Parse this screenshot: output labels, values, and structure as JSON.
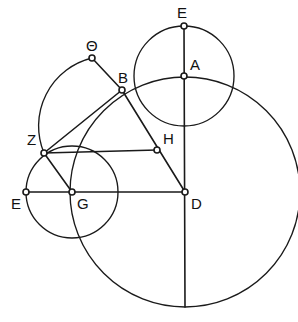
{
  "figure": {
    "background_color": "#ffffff",
    "stroke_color": "#1a1a1a",
    "width": 298,
    "height": 322
  },
  "labels": {
    "theta": "Θ",
    "e_top": "E",
    "a": "A",
    "b": "B",
    "h": "H",
    "z": "Z",
    "e_left": "E",
    "g": "G",
    "d": "D"
  },
  "chart_data": {
    "type": "diagram",
    "xlabel": "",
    "ylabel": "",
    "xlim": [
      0,
      298
    ],
    "ylim": [
      0,
      322
    ],
    "grid": false,
    "legend": "none",
    "points": [
      {
        "name": "Θ",
        "x": 92,
        "y": 58,
        "label_x": 86,
        "label_y": 38
      },
      {
        "name": "E",
        "x": 184,
        "y": 26,
        "label_x": 177,
        "label_y": 5
      },
      {
        "name": "A",
        "x": 184,
        "y": 76,
        "label_x": 190,
        "label_y": 57
      },
      {
        "name": "B",
        "x": 122,
        "y": 90,
        "label_x": 118,
        "label_y": 70
      },
      {
        "name": "H",
        "x": 157,
        "y": 150,
        "label_x": 163,
        "label_y": 131
      },
      {
        "name": "Z",
        "x": 44,
        "y": 153,
        "label_x": 27,
        "label_y": 132
      },
      {
        "name": "E",
        "x": 26,
        "y": 192,
        "label_x": 11,
        "label_y": 196
      },
      {
        "name": "G",
        "x": 72,
        "y": 192,
        "label_x": 77,
        "label_y": 196
      },
      {
        "name": "D",
        "x": 185,
        "y": 192,
        "label_x": 191,
        "label_y": 196
      }
    ],
    "circles": [
      {
        "name": "circle-A",
        "cx": 184,
        "cy": 76,
        "r": 50,
        "note": "small upper circle through E and through D-circle"
      },
      {
        "name": "circle-G",
        "cx": 72,
        "cy": 192,
        "r": 46,
        "note": "small lower-left circle through E(left)"
      },
      {
        "name": "circle-D",
        "cx": 185,
        "cy": 192,
        "r": 115,
        "note": "large circle through A and B"
      }
    ],
    "arcs": [
      {
        "name": "arc-theta-z",
        "cx": 122,
        "cy": 90,
        "r": 70,
        "from": "Θ",
        "to": "Z",
        "note": "arc from Theta curving left-down to Z"
      }
    ],
    "segments": [
      {
        "name": "segment-E-D",
        "x1": 184,
        "y1": 26,
        "x2": 185,
        "y2": 307
      },
      {
        "name": "segment-Eleft-D",
        "x1": 26,
        "y1": 192,
        "x2": 185,
        "y2": 192
      },
      {
        "name": "segment-Z-H",
        "x1": 44,
        "y1": 153,
        "x2": 157,
        "y2": 150
      },
      {
        "name": "segment-theta-B",
        "x1": 92,
        "y1": 58,
        "x2": 122,
        "y2": 90
      },
      {
        "name": "segment-B-D",
        "x1": 122,
        "y1": 90,
        "x2": 185,
        "y2": 192
      },
      {
        "name": "segment-Z-B",
        "x1": 44,
        "y1": 153,
        "x2": 122,
        "y2": 90
      },
      {
        "name": "segment-Z-G",
        "x1": 44,
        "y1": 153,
        "x2": 72,
        "y2": 192
      }
    ]
  }
}
